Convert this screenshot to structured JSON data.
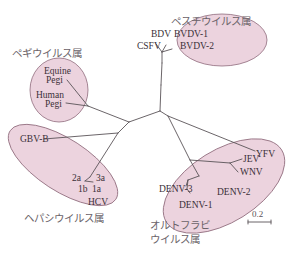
{
  "diagram": {
    "type": "unrooted phylogenetic tree",
    "colors": {
      "clade_fill": "#ecd3de",
      "clade_stroke": "#8f6b7c",
      "branch": "#5a5358",
      "text": "#3a3038",
      "genus_text": "#6a6268"
    },
    "genera": {
      "pestivirus": {
        "label": "ペスチウイルス属",
        "leaves": [
          "BDV",
          "BVDV-1",
          "BVDV-2",
          "CSFV"
        ]
      },
      "pegivirus": {
        "label": "ペギウイルス属",
        "leaves": [
          "Equine",
          "Pegi",
          "Human",
          "Pegi"
        ]
      },
      "hepacivirus": {
        "label": "ヘパシウイルス属",
        "leaves": [
          "GBV-B",
          "2a",
          "3a",
          "1b",
          "1a",
          "HCV"
        ]
      },
      "orthoflavivirus": {
        "label_line1": "オルトフラビ",
        "label_line2": "ウイルス属",
        "leaves": [
          "YFV",
          "JEV",
          "WNV",
          "DENV-2",
          "DENV-3",
          "DENV-1"
        ]
      }
    },
    "scale_bar": {
      "label": "0.2"
    }
  }
}
